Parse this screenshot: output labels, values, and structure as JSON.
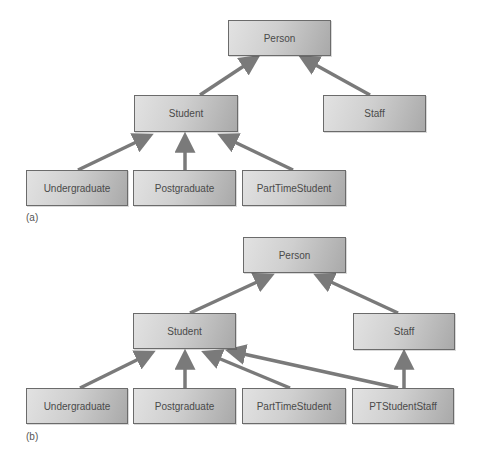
{
  "diagram_a": {
    "caption": "(a)",
    "nodes": {
      "person": "Person",
      "student": "Student",
      "staff": "Staff",
      "undergraduate": "Undergraduate",
      "postgraduate": "Postgraduate",
      "parttimestudent": "PartTimeStudent"
    },
    "edges": [
      [
        "Student",
        "Person"
      ],
      [
        "Staff",
        "Person"
      ],
      [
        "Undergraduate",
        "Student"
      ],
      [
        "Postgraduate",
        "Student"
      ],
      [
        "PartTimeStudent",
        "Student"
      ]
    ]
  },
  "diagram_b": {
    "caption": "(b)",
    "nodes": {
      "person": "Person",
      "student": "Student",
      "staff": "Staff",
      "undergraduate": "Undergraduate",
      "postgraduate": "Postgraduate",
      "parttimestudent": "PartTimeStudent",
      "ptstudentstaff": "PTStudentStaff"
    },
    "edges": [
      [
        "Student",
        "Person"
      ],
      [
        "Staff",
        "Person"
      ],
      [
        "Undergraduate",
        "Student"
      ],
      [
        "Postgraduate",
        "Student"
      ],
      [
        "PartTimeStudent",
        "Student"
      ],
      [
        "PTStudentStaff",
        "Student"
      ],
      [
        "PTStudentStaff",
        "Staff"
      ]
    ]
  },
  "colors": {
    "arrow": "#7a7a7a",
    "box_border": "#6b6b6b",
    "box_light": "#e2e2e2",
    "box_dark": "#a9a9a9"
  }
}
